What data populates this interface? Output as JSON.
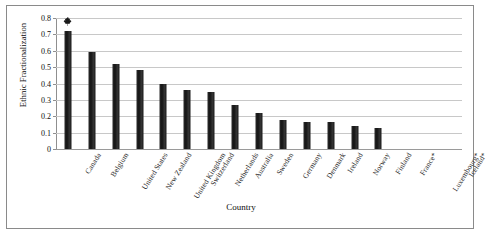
{
  "chart_data": {
    "type": "bar",
    "title": "",
    "xlabel": "Country",
    "ylabel": "Ethnic Fractionalization",
    "ylim": [
      0,
      0.8
    ],
    "ytick_labels": [
      "0.8",
      "0.7",
      "0.6",
      "0.5",
      "0.4",
      "0.3",
      "0.2",
      "0.1",
      "0"
    ],
    "ytick_values": [
      0.8,
      0.7,
      0.6,
      0.5,
      0.4,
      0.3,
      0.2,
      0.1,
      0
    ],
    "grid": true,
    "legend": "none",
    "categories": [
      "Canada",
      "Belgium",
      "United States",
      "New Zealand",
      "United Kingdom",
      "Switzerland",
      "Netherlands",
      "Australia",
      "Sweden",
      "Germany",
      "Denmark",
      "Ireland",
      "Norway",
      "Finland",
      "France*",
      "Luxembourg*",
      "Iceland*"
    ],
    "values": [
      0.72,
      0.59,
      0.52,
      0.48,
      0.4,
      0.36,
      0.35,
      0.27,
      0.22,
      0.18,
      0.165,
      0.165,
      0.14,
      0.13,
      0,
      0,
      0
    ],
    "bar_color": "#232323",
    "annotations": [
      {
        "name": "maple-leaf-marker",
        "icon": "maple-leaf-icon",
        "category": "Canada",
        "value": 0.82
      }
    ]
  }
}
